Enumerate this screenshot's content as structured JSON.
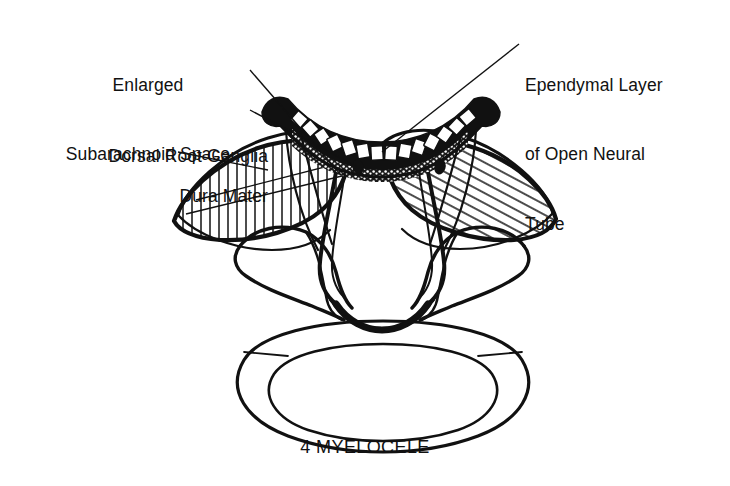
{
  "figure": {
    "caption": "4 MYELOCELE",
    "caption_number": "4",
    "caption_term": "MYELOCELE",
    "background_color": "#ffffff",
    "ink_color": "#111111",
    "width": 730,
    "height": 486,
    "style": "black-and-white line drawing, medical cross-section illustration"
  },
  "labels": {
    "enlarged_subarachnoid_space": {
      "line1": "Enlarged",
      "line2": "Subarachnoid Space",
      "full": "Enlarged Subarachnoid Space"
    },
    "dorsal_root_ganglia": {
      "line1": "Dorsal Root Ganglia",
      "full": "Dorsal Root Ganglia"
    },
    "dura_mater": {
      "line1": "Dura Mater",
      "full": "Dura Mater"
    },
    "ependymal_layer": {
      "line1": "Ependymal Layer",
      "line2": "of Open Neural",
      "line3": "Tube",
      "full": "Ependymal Layer of Open Neural Tube"
    }
  },
  "anatomy": {
    "parts": [
      "open neural tube plate",
      "ependymal cell layer",
      "enlarged subarachnoid space",
      "dura mater",
      "dorsal root ganglia",
      "vertebral body",
      "transverse processes",
      "spinal cord remnant"
    ]
  }
}
